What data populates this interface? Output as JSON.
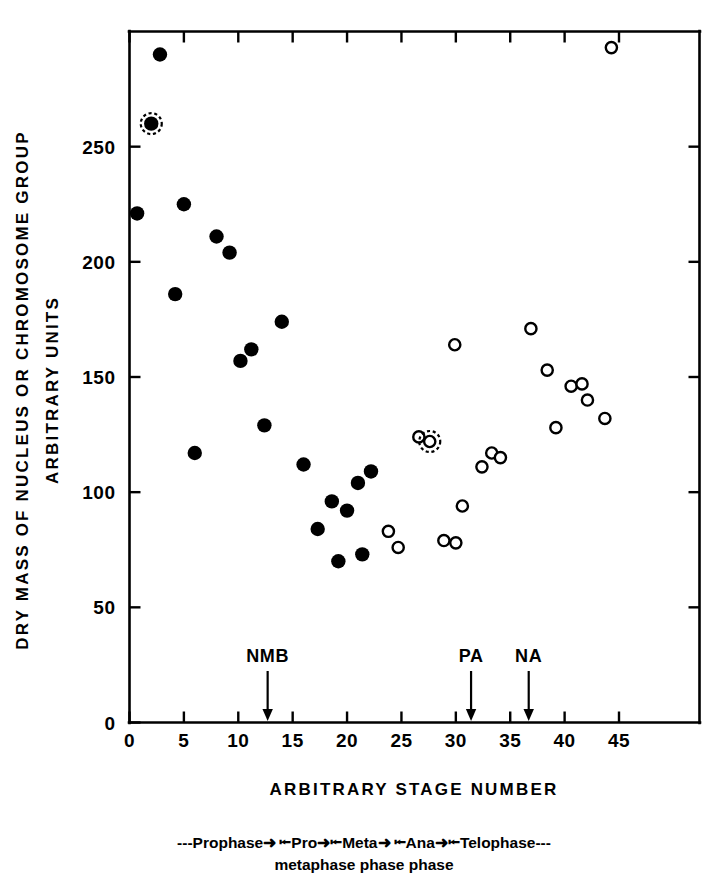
{
  "chart_data": {
    "type": "scatter",
    "title": "",
    "xlabel": "ARBITRARY STAGE NUMBER",
    "ylabel_line1": "DRY MASS OF NUCLEUS OR CHROMOSOME GROUP",
    "ylabel_line2": "ARBITRARY UNITS",
    "xlim": [
      0,
      52.4
    ],
    "ylim": [
      0,
      300
    ],
    "grid": false,
    "legend_position": "none",
    "xticks": [
      0,
      5,
      10,
      15,
      20,
      25,
      30,
      35,
      40,
      45
    ],
    "xticklabels": [
      "0",
      "5",
      "10",
      "15",
      "20",
      "25",
      "30",
      "35",
      "40",
      "45"
    ],
    "yticks": [
      0,
      50,
      100,
      150,
      200,
      250
    ],
    "yticklabels": [
      "0",
      "50",
      "100",
      "150",
      "200",
      "250"
    ],
    "series": [
      {
        "name": "filled",
        "marker": "filled-circle",
        "points": [
          {
            "x": 0.7,
            "y": 221
          },
          {
            "x": 2.0,
            "y": 260,
            "halo": true
          },
          {
            "x": 2.8,
            "y": 290
          },
          {
            "x": 5.0,
            "y": 225
          },
          {
            "x": 4.2,
            "y": 186
          },
          {
            "x": 6.0,
            "y": 117
          },
          {
            "x": 8.0,
            "y": 211
          },
          {
            "x": 9.2,
            "y": 204
          },
          {
            "x": 10.2,
            "y": 157
          },
          {
            "x": 11.2,
            "y": 162
          },
          {
            "x": 12.4,
            "y": 129
          },
          {
            "x": 14.0,
            "y": 174
          },
          {
            "x": 16.0,
            "y": 112
          },
          {
            "x": 17.3,
            "y": 84
          },
          {
            "x": 18.6,
            "y": 96
          },
          {
            "x": 19.2,
            "y": 70
          },
          {
            "x": 20.0,
            "y": 92
          },
          {
            "x": 21.0,
            "y": 104
          },
          {
            "x": 21.4,
            "y": 73
          },
          {
            "x": 22.2,
            "y": 109
          }
        ]
      },
      {
        "name": "open",
        "marker": "open-circle",
        "points": [
          {
            "x": 23.8,
            "y": 83
          },
          {
            "x": 24.7,
            "y": 76
          },
          {
            "x": 26.6,
            "y": 124
          },
          {
            "x": 27.6,
            "y": 122,
            "halo": true
          },
          {
            "x": 28.9,
            "y": 79
          },
          {
            "x": 30.0,
            "y": 78
          },
          {
            "x": 29.9,
            "y": 164
          },
          {
            "x": 30.6,
            "y": 94
          },
          {
            "x": 32.4,
            "y": 111
          },
          {
            "x": 33.3,
            "y": 117
          },
          {
            "x": 34.1,
            "y": 115
          },
          {
            "x": 36.9,
            "y": 171
          },
          {
            "x": 38.4,
            "y": 153
          },
          {
            "x": 39.2,
            "y": 128
          },
          {
            "x": 40.6,
            "y": 146
          },
          {
            "x": 41.6,
            "y": 147
          },
          {
            "x": 42.1,
            "y": 140
          },
          {
            "x": 43.7,
            "y": 132
          },
          {
            "x": 44.3,
            "y": 293
          }
        ]
      }
    ],
    "annotations": [
      {
        "label": "NMB",
        "x": 12.7
      },
      {
        "label": "PA",
        "x": 31.4
      },
      {
        "label": "NA",
        "x": 36.7
      }
    ],
    "phase_bar": {
      "line1": [
        {
          "text": "---",
          "kind": "dash"
        },
        {
          "text": "Prophase",
          "kind": "word"
        },
        {
          "text": "➜ ⭰",
          "kind": "arrows"
        },
        {
          "text": "Pro",
          "kind": "word"
        },
        {
          "text": "➜⭰",
          "kind": "arrows"
        },
        {
          "text": "Meta",
          "kind": "word"
        },
        {
          "text": "➜ ⭰",
          "kind": "arrows"
        },
        {
          "text": "Ana",
          "kind": "word"
        },
        {
          "text": "➜⭰",
          "kind": "arrows"
        },
        {
          "text": "Telophase",
          "kind": "word"
        },
        {
          "text": "---",
          "kind": "dash"
        }
      ],
      "line1_plain": "---Prophase ➜ ⭰Pro➜ ⭰Meta➜ ⭰Ana➜ ⭰Telophase---",
      "line2_parts": [
        "metaphase",
        "phase",
        "phase"
      ],
      "line2_plain": "metaphase  phase  phase"
    }
  }
}
